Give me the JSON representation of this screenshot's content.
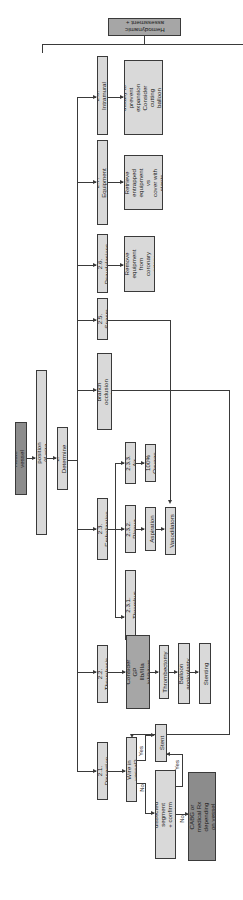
{
  "diagram": {
    "orientation": "rotated 90 degrees; text reads bottom-to-top",
    "nodes": {
      "start": "Acute vessel closure",
      "step1": "1. Maintain wire position (if wire already in vessel)",
      "step2": "2. Determine cause",
      "step3": "3. Hemodynamic\nassessment + support",
      "c21": "2.1. Dissection",
      "c22": "2.2. Thrombosis",
      "c23": "2.3. Embolization",
      "c24": "2.4. Side branch\nocclusion after stenting",
      "c25": "2.5. Spasm",
      "c26": "2.6. Pseudolesions",
      "c27": "2.7. Equipment entrapment",
      "c28": "2.8. Intramural hematoma",
      "wire_q": "Wire in vessel?",
      "able_q": "Able to wire through\ndissected segment + confirm\ndistal true lumen position?",
      "stent": "Stent",
      "emergency": "Emergency CABG or\nmedical Rx depending\non vessel size",
      "check_act": "Check ACT.\nConsider GP IIb/IIIa\ninhibitors or cangrelor",
      "thrombectomy": "Thrombectomy",
      "balloon": "Balloon angioplasty",
      "stenting": "Stenting",
      "e231": "2.3.1. Thrombus",
      "e232": "2.3.2. Plaque",
      "e233": "2.3.3. Air",
      "aspiration": "Aspiration",
      "oxygen": "100% Oxygen",
      "vasodilators": "Vasodilators",
      "pseudo_action": "Remove\nequipment\nfrom coronary\nartery",
      "entrap_action": "Retrieve\nentrapped\nequipment vs\ncover with\nstents",
      "hematoma_action": "Stent distally to\nprevent expansion\nConsider cutting balloon\nto decompress"
    },
    "edge_labels": {
      "yes1": "Yes",
      "no1": "No",
      "yes2": "Yes",
      "no2": "No"
    },
    "colors": {
      "light_box": "#d9d9d9",
      "mid_box": "#a6a6a6",
      "dark_box": "#8c8c8c",
      "line": "#3a3a3a"
    }
  }
}
